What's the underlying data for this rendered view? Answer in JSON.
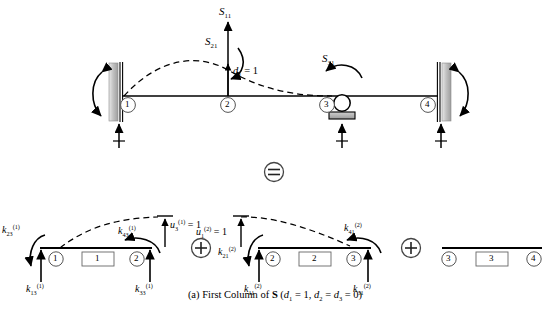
{
  "figure": {
    "caption_prefix": "(a) First Column of ",
    "caption_bold": "S",
    "caption_suffix": " (d",
    "caption_full": "(a) First Column of S (d1 = 1, d2 = d3 = 0)",
    "operator_equals": "=",
    "operator_plus": "+"
  },
  "top_assembly": {
    "name": "continuous-beam-assembly",
    "forces": [
      {
        "id": "S11",
        "base": "S",
        "sub": "11",
        "kind": "vertical-force"
      },
      {
        "id": "S21",
        "base": "S",
        "sub": "21",
        "kind": "moment"
      },
      {
        "id": "S31",
        "base": "S",
        "sub": "31",
        "kind": "moment"
      }
    ],
    "displacement": {
      "base": "d",
      "sub": "1",
      "value": "= 1",
      "text": "d1 = 1"
    },
    "nodes": [
      {
        "label": "1",
        "support": "fixed-wall-left"
      },
      {
        "label": "2",
        "support": "none"
      },
      {
        "label": "3",
        "support": "roller"
      },
      {
        "label": "4",
        "support": "fixed-wall-right"
      }
    ],
    "deflected_shape": "dashed-curve"
  },
  "decomposition": {
    "elements": [
      {
        "element_label": "1",
        "name": "element-1",
        "nodes": [
          "1",
          "2"
        ],
        "unit_displacement": {
          "base": "u",
          "sub": "3",
          "sup": "(1)",
          "value": "= 1",
          "text": "u3(1) = 1"
        },
        "stiffness_terms": [
          {
            "base": "k",
            "sub": "23",
            "sup": "(1)",
            "text": "k23(1)",
            "kind": "moment"
          },
          {
            "base": "k",
            "sub": "13",
            "sup": "(1)",
            "text": "k13(1)",
            "kind": "vertical-force"
          },
          {
            "base": "k",
            "sub": "43",
            "sup": "(1)",
            "text": "k43(1)",
            "kind": "moment"
          },
          {
            "base": "k",
            "sub": "33",
            "sup": "(1)",
            "text": "k33(1)",
            "kind": "vertical-force"
          }
        ],
        "deflected_shape": "dashed-curve"
      },
      {
        "element_label": "2",
        "name": "element-2",
        "nodes": [
          "2",
          "3"
        ],
        "unit_displacement": {
          "base": "u",
          "sub": "1",
          "sup": "(2)",
          "value": "= 1",
          "text": "u1(2) = 1"
        },
        "stiffness_terms": [
          {
            "base": "k",
            "sub": "21",
            "sup": "(2)",
            "text": "k21(2)",
            "kind": "moment"
          },
          {
            "base": "k",
            "sub": "11",
            "sup": "(2)",
            "text": "k11(2)",
            "kind": "vertical-force"
          },
          {
            "base": "k",
            "sub": "41",
            "sup": "(2)",
            "text": "k41(2)",
            "kind": "moment"
          },
          {
            "base": "k",
            "sub": "31",
            "sup": "(2)",
            "text": "k31(2)",
            "kind": "vertical-force"
          }
        ],
        "deflected_shape": "dashed-curve"
      },
      {
        "element_label": "3",
        "name": "element-3",
        "nodes": [
          "3",
          "4"
        ],
        "unit_displacement": null,
        "stiffness_terms": [],
        "deflected_shape": "none"
      }
    ]
  },
  "caption_parts": {
    "a": "(a) First Column of ",
    "S": "S",
    "open": " (",
    "d1": "d",
    "d1sub": "1",
    "eq1": " = 1, ",
    "d2": "d",
    "d2sub": "2",
    "eq2": " = ",
    "d3": "d",
    "d3sub": "3",
    "eq3": " = 0)"
  },
  "colors": {
    "line": "#000000",
    "wall_fill": "#c9c9c9",
    "support_fill": "#b5b5b5",
    "background": "#ffffff"
  }
}
